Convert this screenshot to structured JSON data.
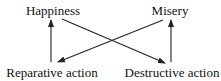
{
  "diagram": {
    "nodes": [
      {
        "id": "happiness",
        "label": "Happiness",
        "x": 53,
        "y": 4
      },
      {
        "id": "misery",
        "label": "Misery",
        "x": 170,
        "y": 4
      },
      {
        "id": "reparative",
        "label": "Reparative action",
        "x": 52,
        "y": 66
      },
      {
        "id": "destructive",
        "label": "Destructive action",
        "x": 172,
        "y": 66
      }
    ],
    "edges": [
      {
        "from": "reparative",
        "to": "happiness",
        "x1": 51,
        "y1": 62,
        "x2": 51,
        "y2": 20
      },
      {
        "from": "destructive",
        "to": "misery",
        "x1": 171,
        "y1": 62,
        "x2": 171,
        "y2": 20
      },
      {
        "from": "happiness",
        "to": "destructive",
        "x1": 62,
        "y1": 19,
        "x2": 165,
        "y2": 63
      },
      {
        "from": "misery",
        "to": "reparative",
        "x1": 163,
        "y1": 20,
        "x2": 58,
        "y2": 62
      }
    ],
    "stroke_color": "#222222"
  }
}
